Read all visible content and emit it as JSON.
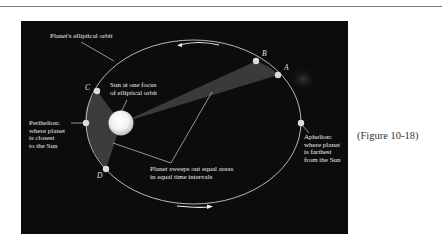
{
  "figure": {
    "caption": "(Figure 10-18)",
    "background_color": "#0c0c0c",
    "orbit_color": "#c9c9c9",
    "sweep_color": "#3a3a3a",
    "sun_color": "#ffffff"
  },
  "labels": {
    "orbit": "Planet's elliptical orbit",
    "sun": "Sun at one focus\nof elliptical orbit",
    "perihelion": "Perihelion:\nwhere planet\nis closest\nto the Sun",
    "aphelion": "Aphelion:\nwhere planet\nis farthest\nfrom the Sun",
    "sweep": "Planet sweeps out equal areas\nin equal time intervals"
  },
  "points": {
    "A": "A",
    "B": "B",
    "C": "C",
    "D": "D"
  },
  "arrows": {
    "top": "counterclockwise-arrow",
    "bottom": "clockwise-arrow"
  }
}
